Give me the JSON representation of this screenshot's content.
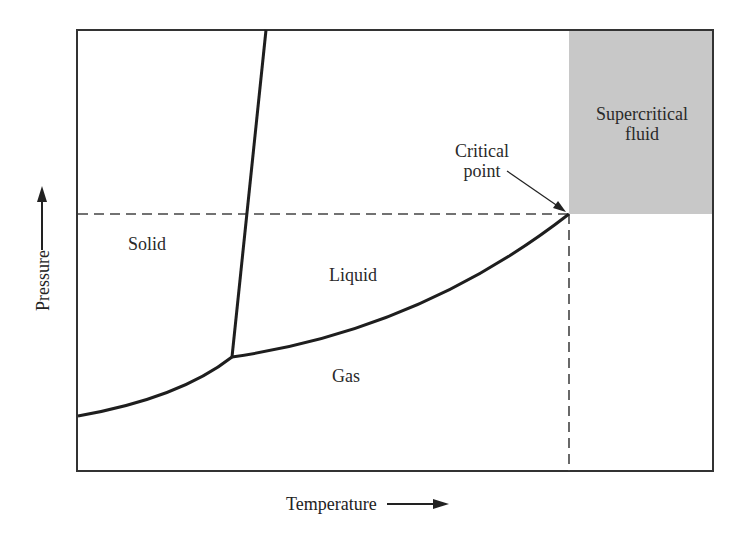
{
  "diagram": {
    "type": "phase diagram",
    "axes": {
      "x_label": "Temperature",
      "y_label": "Pressure",
      "x_arrow": "arrow-right",
      "y_arrow": "arrow-up"
    },
    "regions": [
      {
        "id": "solid",
        "label": "Solid"
      },
      {
        "id": "liquid",
        "label": "Liquid"
      },
      {
        "id": "gas",
        "label": "Gas"
      },
      {
        "id": "supercritical",
        "label_line1": "Supercritical",
        "label_line2": "fluid",
        "fill": "#c8c8c8"
      }
    ],
    "annotations": {
      "critical_point_line1": "Critical",
      "critical_point_line2": "point"
    },
    "curves": [
      "sublimation curve",
      "melting curve",
      "vaporization curve"
    ],
    "points": [
      "triple point",
      "critical point"
    ],
    "colors": {
      "line": "#1e1e1e",
      "frame": "#333333",
      "dashed": "#444444",
      "supercritical_fill": "#c8c8c8"
    }
  }
}
